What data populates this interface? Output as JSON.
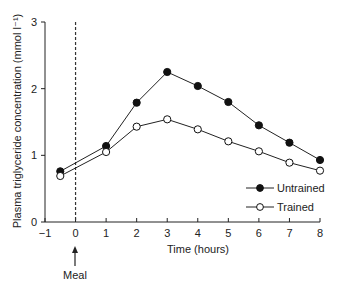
{
  "chart_data": {
    "type": "line",
    "title": "",
    "xlabel": "Time (hours)",
    "ylabel": "Plasma triglyceride concentration (mmol l⁻¹)",
    "xlim": [
      -1,
      8
    ],
    "ylim": [
      0,
      3
    ],
    "x_ticks": [
      -1,
      0,
      1,
      2,
      3,
      4,
      5,
      6,
      7,
      8
    ],
    "x_tick_labels": [
      "−1",
      "0",
      "1",
      "2",
      "3",
      "4",
      "5",
      "6",
      "7",
      "8"
    ],
    "y_ticks": [
      0,
      1,
      2,
      3
    ],
    "y_tick_labels": [
      "0",
      "1",
      "2",
      "3"
    ],
    "grid": false,
    "legend_position": "lower right",
    "x": [
      -0.5,
      1,
      2,
      3,
      4,
      5,
      6,
      7,
      8
    ],
    "series": [
      {
        "name": "Untrained",
        "marker": "filled-circle",
        "values": [
          0.76,
          1.14,
          1.79,
          2.25,
          2.04,
          1.8,
          1.45,
          1.19,
          0.93
        ]
      },
      {
        "name": "Trained",
        "marker": "open-circle",
        "values": [
          0.69,
          1.05,
          1.43,
          1.54,
          1.39,
          1.21,
          1.06,
          0.89,
          0.77
        ]
      }
    ],
    "annotations": [
      {
        "type": "vertical-dashed-line",
        "x": 0
      },
      {
        "type": "arrow",
        "x": 0,
        "label": "Meal"
      }
    ]
  },
  "labels": {
    "meal": "Meal",
    "legend_untrained": "Untrained",
    "legend_trained": "Trained"
  }
}
